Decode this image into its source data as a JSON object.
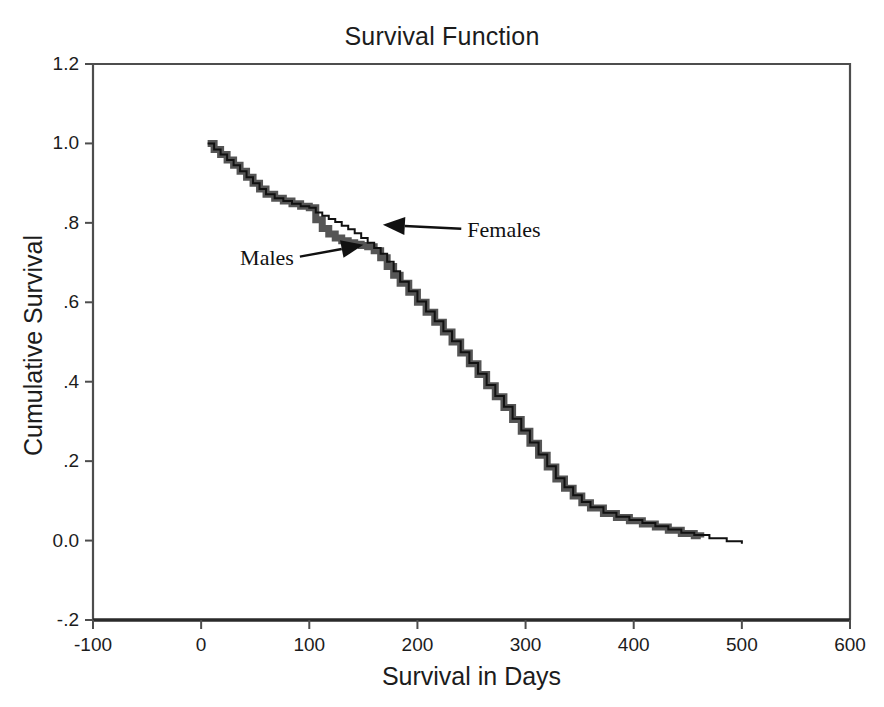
{
  "chart_data": {
    "type": "line",
    "title": "Survival Function",
    "xlabel": "Survival in Days",
    "ylabel": "Cumulative Survival",
    "xlim": [
      -100,
      600
    ],
    "ylim": [
      -0.2,
      1.2
    ],
    "xticks": [
      -100,
      0,
      100,
      200,
      300,
      400,
      500,
      600
    ],
    "xticklabels": [
      "-100",
      "0",
      "100",
      "200",
      "300",
      "400",
      "500",
      "600"
    ],
    "yticks": [
      -0.2,
      0.0,
      0.2,
      0.4,
      0.6,
      0.8,
      1.0,
      1.2
    ],
    "yticklabels": [
      "-.2",
      "0.0",
      ".2",
      ".4",
      ".6",
      ".8",
      "1.0",
      "1.2"
    ],
    "grid": false,
    "legend_position": "none",
    "annotations": [
      {
        "label": "Males",
        "text_x": 95,
        "text_y": 0.715,
        "point_x": 150,
        "point_y": 0.745
      },
      {
        "label": "Females",
        "text_x": 235,
        "text_y": 0.785,
        "point_x": 168,
        "point_y": 0.795
      }
    ],
    "series": [
      {
        "name": "Males",
        "color": "#555555",
        "line_width": 7,
        "style": "step",
        "x": [
          6,
          12,
          18,
          24,
          30,
          36,
          42,
          48,
          54,
          60,
          68,
          76,
          84,
          92,
          100,
          106,
          112,
          118,
          124,
          130,
          136,
          142,
          148,
          154,
          160,
          166,
          172,
          178,
          184,
          192,
          200,
          208,
          216,
          224,
          232,
          240,
          248,
          256,
          264,
          272,
          280,
          288,
          296,
          304,
          312,
          320,
          328,
          336,
          344,
          352,
          360,
          372,
          384,
          396,
          408,
          420,
          432,
          444,
          456,
          462
        ],
        "y": [
          1.0,
          0.985,
          0.972,
          0.958,
          0.945,
          0.93,
          0.915,
          0.9,
          0.885,
          0.872,
          0.862,
          0.855,
          0.848,
          0.842,
          0.838,
          0.808,
          0.786,
          0.772,
          0.762,
          0.755,
          0.75,
          0.746,
          0.743,
          0.74,
          0.73,
          0.712,
          0.69,
          0.668,
          0.648,
          0.625,
          0.6,
          0.575,
          0.55,
          0.525,
          0.5,
          0.472,
          0.445,
          0.418,
          0.39,
          0.362,
          0.335,
          0.305,
          0.275,
          0.245,
          0.215,
          0.185,
          0.155,
          0.132,
          0.112,
          0.095,
          0.082,
          0.068,
          0.058,
          0.05,
          0.042,
          0.034,
          0.026,
          0.018,
          0.012,
          0.008
        ]
      },
      {
        "name": "Females",
        "color": "#111111",
        "line_width": 2,
        "style": "step",
        "x": [
          6,
          12,
          18,
          24,
          30,
          36,
          42,
          48,
          54,
          60,
          68,
          76,
          84,
          92,
          100,
          106,
          112,
          118,
          124,
          130,
          136,
          142,
          148,
          154,
          160,
          166,
          172,
          178,
          184,
          192,
          200,
          208,
          216,
          224,
          232,
          240,
          248,
          256,
          264,
          272,
          280,
          288,
          296,
          304,
          312,
          320,
          328,
          336,
          344,
          352,
          360,
          372,
          384,
          396,
          408,
          420,
          432,
          444,
          456,
          470,
          486,
          500
        ],
        "y": [
          1.0,
          0.985,
          0.972,
          0.958,
          0.945,
          0.93,
          0.915,
          0.9,
          0.885,
          0.872,
          0.862,
          0.855,
          0.848,
          0.842,
          0.838,
          0.826,
          0.818,
          0.81,
          0.802,
          0.793,
          0.784,
          0.774,
          0.762,
          0.75,
          0.737,
          0.722,
          0.702,
          0.678,
          0.652,
          0.628,
          0.602,
          0.577,
          0.552,
          0.527,
          0.502,
          0.474,
          0.447,
          0.42,
          0.392,
          0.364,
          0.337,
          0.307,
          0.277,
          0.247,
          0.217,
          0.187,
          0.157,
          0.134,
          0.114,
          0.097,
          0.084,
          0.07,
          0.06,
          0.052,
          0.044,
          0.036,
          0.028,
          0.02,
          0.014,
          0.006,
          -0.002,
          -0.008
        ]
      }
    ]
  },
  "axes": {
    "frame_color": "#4d4d4d"
  }
}
